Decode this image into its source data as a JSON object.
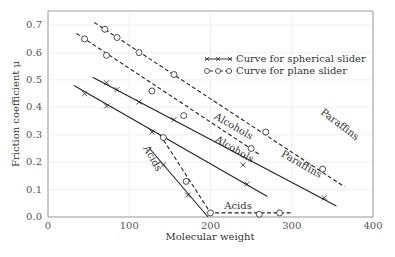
{
  "chart_data": {
    "type": "line",
    "title": "",
    "xlabel": "Molecular weight",
    "ylabel": "Friction coefficient μ",
    "xlim": [
      0,
      400
    ],
    "ylim": [
      0,
      0.75
    ],
    "xticks": [
      "0",
      "100",
      "200",
      "300",
      "400"
    ],
    "yticks": [
      "0.0",
      "0.1",
      "0.2",
      "0.3",
      "0.4",
      "0.5",
      "0.6",
      "0.7"
    ],
    "grid": true,
    "legend_position": "upper right",
    "legend": [
      "Curve for spherical slider",
      "Curve for plane slider"
    ],
    "annotations": [
      "Paraffins",
      "Alcohols",
      "Acids",
      "Alcohols",
      "Paraffins",
      "Acids"
    ],
    "series": [
      {
        "name": "Paraffins (plane slider)",
        "style": "dashed-circle",
        "line": [
          [
            57,
            0.71
          ],
          [
            365,
            0.11
          ]
        ],
        "markers": [
          [
            70,
            0.685
          ],
          [
            85,
            0.655
          ],
          [
            112,
            0.6
          ],
          [
            155,
            0.52
          ],
          [
            268,
            0.31
          ],
          [
            338,
            0.175
          ]
        ]
      },
      {
        "name": "Alcohols (plane slider)",
        "style": "dashed-circle",
        "line": [
          [
            35,
            0.67
          ],
          [
            262,
            0.225
          ]
        ],
        "markers": [
          [
            45,
            0.65
          ],
          [
            72,
            0.59
          ],
          [
            128,
            0.46
          ],
          [
            167,
            0.37
          ],
          [
            250,
            0.25
          ]
        ]
      },
      {
        "name": "Paraffins (spherical slider)",
        "style": "solid-cross",
        "line": [
          [
            55,
            0.51
          ],
          [
            355,
            0.04
          ]
        ],
        "markers": [
          [
            72,
            0.49
          ],
          [
            85,
            0.465
          ],
          [
            112,
            0.42
          ],
          [
            155,
            0.355
          ],
          [
            240,
            0.19
          ],
          [
            340,
            0.07
          ]
        ]
      },
      {
        "name": "Alcohols (spherical slider)",
        "style": "solid-cross",
        "line": [
          [
            32,
            0.48
          ],
          [
            270,
            0.075
          ]
        ],
        "markers": [
          [
            45,
            0.45
          ],
          [
            72,
            0.405
          ],
          [
            128,
            0.31
          ],
          [
            245,
            0.12
          ]
        ]
      },
      {
        "name": "Acids (spherical slider)",
        "style": "solid-cross",
        "line": [
          [
            125,
            0.25
          ],
          [
            197,
            0.0
          ]
        ],
        "markers": [
          [
            142,
            0.19
          ],
          [
            172,
            0.08
          ]
        ]
      },
      {
        "name": "Acids (plane slider)",
        "style": "dashed-circle",
        "line": [
          [
            138,
            0.3
          ],
          [
            200,
            0.015
          ],
          [
            300,
            0.015
          ]
        ],
        "markers": [
          [
            142,
            0.29
          ],
          [
            170,
            0.13
          ],
          [
            200,
            0.015
          ],
          [
            260,
            0.01
          ],
          [
            285,
            0.015
          ]
        ]
      }
    ]
  }
}
